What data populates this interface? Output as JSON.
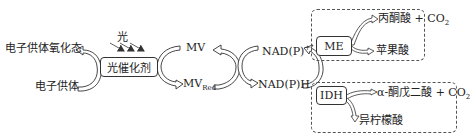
{
  "light": {
    "label": "光"
  },
  "photocatalyst": {
    "label": "光催化剂"
  },
  "electron_donor": {
    "oxidized_label": "电子供体氧化态",
    "reduced_label": "电子供体"
  },
  "mediator": {
    "oxidized_label": "MV",
    "reduced_base": "MV",
    "reduced_sub": "Red"
  },
  "cofactor": {
    "oxidized_base": "NAD(P)",
    "oxidized_sup": "+",
    "reduced_label": "NAD(P)H"
  },
  "me_module": {
    "enzyme": "ME",
    "substrate": "丙酮酸 + CO",
    "substrate_sub": "2",
    "product": "苹果酸"
  },
  "idh_module": {
    "enzyme": "IDH",
    "substrate": "α-酮戊二酸 + CO",
    "substrate_sub": "2",
    "product": "异柠檬酸"
  },
  "colors": {
    "line": "#333333",
    "dash": "#555555"
  }
}
